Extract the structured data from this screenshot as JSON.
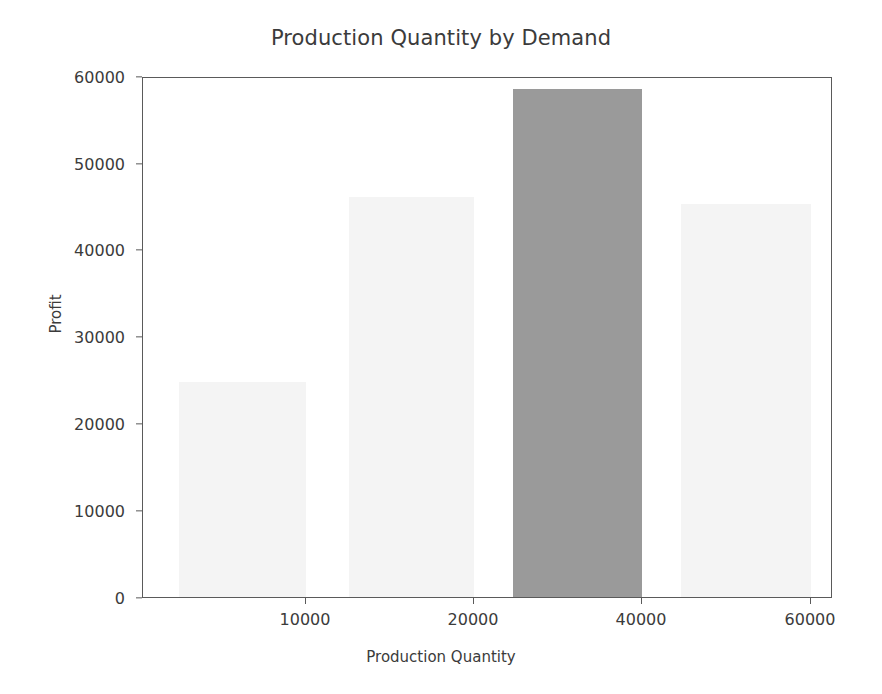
{
  "chart_data": {
    "type": "bar",
    "title": "Production Quantity by Demand",
    "xlabel": "Production Quantity",
    "ylabel": "Profit",
    "xlim": [
      0,
      63500
    ],
    "ylim": [
      0,
      60000
    ],
    "grid": false,
    "legend": null,
    "xticks": [
      {
        "value": 10000,
        "label": "10000",
        "px": 305
      },
      {
        "value": 20000,
        "label": "20000",
        "px": 473
      },
      {
        "value": 40000,
        "label": "40000",
        "px": 641
      },
      {
        "value": 60000,
        "label": "60000",
        "px": 810
      }
    ],
    "yticks": [
      {
        "value": 0,
        "label": "0",
        "px": 598
      },
      {
        "value": 10000,
        "label": "10000",
        "px": 511
      },
      {
        "value": 20000,
        "label": "20000",
        "px": 424
      },
      {
        "value": 30000,
        "label": "30000",
        "px": 337
      },
      {
        "value": 40000,
        "label": "40000",
        "px": 250
      },
      {
        "value": 50000,
        "label": "50000",
        "px": 164
      },
      {
        "value": 60000,
        "label": "60000",
        "px": 77
      }
    ],
    "bars": [
      {
        "name": "bar-1",
        "x_start": 2100,
        "x_end": 10000,
        "value": 25300,
        "highlighted": false,
        "color": "#f4f4f4",
        "px": {
          "left": 36,
          "width": 127,
          "top": 306,
          "height": 215
        }
      },
      {
        "name": "bar-2",
        "x_start": 13000,
        "x_end": 20000,
        "value": 46000,
        "highlighted": false,
        "color": "#f4f4f4",
        "px": {
          "left": 206,
          "width": 125,
          "top": 121,
          "height": 400
        }
      },
      {
        "name": "bar-3",
        "x_start": 25000,
        "x_end": 40000,
        "value": 58000,
        "highlighted": true,
        "color": "#9a9a9a",
        "px": {
          "left": 370,
          "width": 129,
          "top": 13,
          "height": 508
        }
      },
      {
        "name": "bar-4",
        "x_start": 45000,
        "x_end": 60000,
        "value": 45000,
        "highlighted": false,
        "color": "#f4f4f4",
        "px": {
          "left": 538,
          "width": 130,
          "top": 128,
          "height": 393
        }
      }
    ],
    "categories": [
      "2100-10000",
      "13000-20000",
      "25000-40000",
      "45000-60000"
    ],
    "values": [
      25300,
      46000,
      58000,
      45000
    ]
  },
  "style": {
    "axis_color": "#5a5a5a",
    "text_color": "#3b3b3b",
    "background": "#ffffff",
    "bar_color": "#f4f4f4",
    "highlight_color": "#9a9a9a"
  }
}
